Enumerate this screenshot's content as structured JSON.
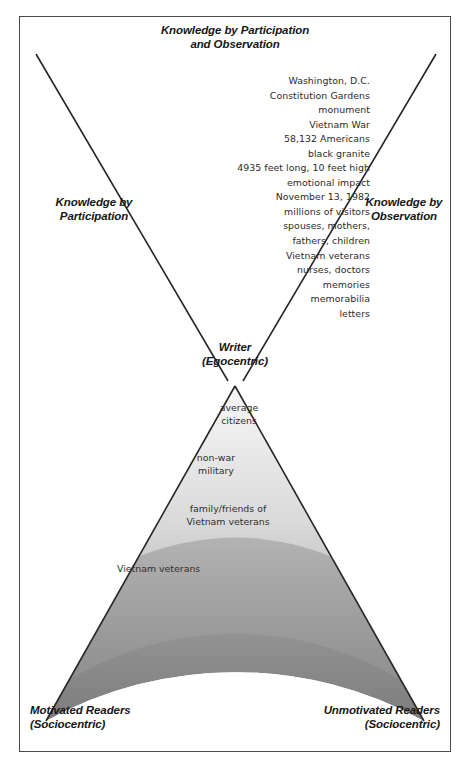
{
  "figure": {
    "title_lines": [
      "Knowledge by Participation",
      "and Observation"
    ],
    "left_label_lines": [
      "Knowledge by",
      "Participation"
    ],
    "right_label_lines": [
      "Knowledge by",
      "Observation"
    ],
    "center_label_lines": [
      "Writer",
      "(Egocentric)"
    ],
    "bottom_left_lines": [
      "Motivated Readers",
      "(Sociocentric)"
    ],
    "bottom_right_lines": [
      "Unmotivated Readers",
      "(Sociocentric)"
    ],
    "detail_list": [
      "Washington, D.C.",
      "Constitution Gardens",
      "monument",
      "Vietnam War",
      "58,132 Americans",
      "black granite",
      "4935 feet long, 10 feet high",
      "emotional impact",
      "November 13, 1982",
      "millions of visitors",
      "spouses, mothers,",
      "fathers, children",
      "Vietnam veterans",
      "nurses, doctors",
      "memories",
      "memorabilia",
      "letters"
    ],
    "audience_bands": [
      {
        "label": "average\ncitizens",
        "fill_top": "#8e8e8e",
        "fill_bottom": "#6b6b6b"
      },
      {
        "label": "non-war\nmilitary",
        "fill_top": "#e9e9e9",
        "fill_bottom": "#c9c9c9"
      },
      {
        "label": "family/friends of\nVietnam veterans",
        "fill_top": "#f2f2f2",
        "fill_bottom": "#d3d3d3"
      },
      {
        "label": "Vietnam veterans",
        "fill_top": "#f5f5f5",
        "fill_bottom": "#bdbdbd"
      },
      {
        "label": "",
        "fill_top": "#d8d8d8",
        "fill_bottom": "#8a8a8a"
      },
      {
        "label": "",
        "fill_top": "#cfcfcf",
        "fill_bottom": "#7e7e7e"
      }
    ],
    "colors": {
      "frame_stroke": "#4a4a4a",
      "line_stroke": "#262626",
      "text": "#1a1a1a",
      "detail_text": "#2b2b2b",
      "background": "#ffffff"
    }
  }
}
